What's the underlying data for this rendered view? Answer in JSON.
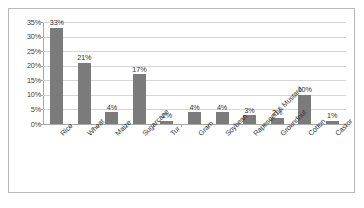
{
  "chart_data": {
    "type": "bar",
    "title": "",
    "subtitle": "",
    "xlabel": "",
    "ylabel": "",
    "ylim": [
      0,
      35
    ],
    "ytick_labels": [
      "35%",
      "30%",
      "25%",
      "20%",
      "15%",
      "10%",
      "5%",
      "0%"
    ],
    "ytick_values": [
      35,
      30,
      25,
      20,
      15,
      10,
      5,
      0
    ],
    "grid": true,
    "legend": false,
    "legend_position": "none",
    "bar_color": "#7b7b7b",
    "categories": [
      "Rice",
      "Wheat",
      "Maize",
      "Sugarcane",
      "Tur",
      "Gram",
      "Soybean",
      "Rapeseed & Mustard",
      "Groundnut",
      "Cotton",
      "Castor"
    ],
    "values": [
      33,
      21,
      4,
      17,
      1,
      4,
      4,
      3,
      2,
      10,
      1
    ],
    "data_labels": [
      "33%",
      "21%",
      "4%",
      "17%",
      "1%",
      "4%",
      "4%",
      "3%",
      "2%",
      "10%",
      "1%"
    ]
  }
}
